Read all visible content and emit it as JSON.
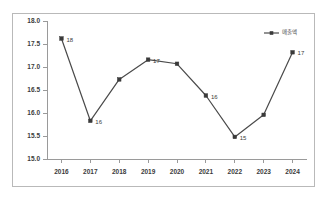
{
  "chart_data": {
    "type": "line",
    "title": "",
    "xlabel": "",
    "ylabel": "",
    "categories": [
      "2016",
      "2017",
      "2018",
      "2019",
      "2020",
      "2021",
      "2022",
      "2023",
      "2024"
    ],
    "series": [
      {
        "name": "매출액",
        "values": [
          17.62,
          15.83,
          16.73,
          17.16,
          17.07,
          16.38,
          15.48,
          15.96,
          17.32
        ],
        "point_labels": [
          "18",
          "16",
          "",
          "17",
          "",
          "16",
          "15",
          "",
          "17"
        ],
        "color": "#4a4a4a",
        "marker_color": "#3a3a3a"
      }
    ],
    "ylim": [
      15.0,
      18.0
    ],
    "ytick_labels": [
      "18.0",
      "17.5",
      "17.0",
      "16.5",
      "16.0",
      "15.5",
      "15.0"
    ],
    "ytick_values": [
      18.0,
      17.5,
      17.0,
      16.5,
      16.0,
      15.5,
      15.0
    ],
    "grid": false,
    "legend_position": "top-right"
  },
  "legend": {
    "entries": [
      {
        "label": "매출액"
      }
    ]
  },
  "frame": {
    "border_color": "#b9b9b9",
    "background": "#ffffff"
  }
}
